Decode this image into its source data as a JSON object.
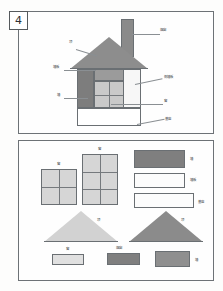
{
  "page": {
    "number": "4",
    "background": "#fdfdfc",
    "border_color": "#6d7276"
  },
  "palette": {
    "roof_gray": "#8d8d8d",
    "chimney_gray": "#8a8a8a",
    "wall_dark": "#7d7d7d",
    "wall_light": "#c9c9c9",
    "wall_white": "#f7f7f7",
    "foundation_white": "#ffffff",
    "window_light": "#d6d6d6",
    "triangle_light": "#d2d2d2",
    "triangle_dark": "#8b8b8b",
    "rect_dark": "#7f7f7f",
    "rect_medium": "#8f8f8f",
    "rect_light": "#e0e0e0",
    "rect_white": "#fcfcfc",
    "outline": "#6a6f73",
    "leader": "#8a8f93",
    "text": "#44484b"
  },
  "top_panel": {
    "title": "house-assembly-diagram",
    "labels": [
      {
        "id": "chimney",
        "text": "烟囱",
        "x": 158,
        "y": 29
      },
      {
        "id": "roof",
        "text": "顶",
        "x": 69,
        "y": 41
      },
      {
        "id": "gable",
        "text": "墙板",
        "x": 58,
        "y": 65
      },
      {
        "id": "wall",
        "text": "墙",
        "x": 58,
        "y": 93
      },
      {
        "id": "side-panel",
        "text": "侧墙板",
        "x": 163,
        "y": 78
      },
      {
        "id": "window",
        "text": "窗",
        "x": 163,
        "y": 99
      },
      {
        "id": "base",
        "text": "基座",
        "x": 163,
        "y": 119
      }
    ],
    "parts": [
      {
        "id": "chimney",
        "name": "chimney-shape"
      },
      {
        "id": "roof",
        "name": "roof-triangle"
      },
      {
        "id": "wall-dark",
        "name": "left-wall-panel"
      },
      {
        "id": "wall-white",
        "name": "right-wall-panel"
      },
      {
        "id": "window-grid",
        "name": "window-grid"
      },
      {
        "id": "foundation",
        "name": "foundation-strip"
      }
    ]
  },
  "bottom_panel": {
    "title": "parts-inventory",
    "items": [
      {
        "id": "window-small",
        "label": "窗",
        "shape": "grid",
        "cols": 2,
        "rows": 2,
        "fill": "#d6d6d6"
      },
      {
        "id": "window-tall",
        "label": "窗",
        "shape": "grid",
        "cols": 2,
        "rows": 3,
        "fill": "#d6d6d6"
      },
      {
        "id": "wall-dark",
        "label": "墙",
        "shape": "rect",
        "fill": "#7f7f7f"
      },
      {
        "id": "wall-板",
        "label": "墙板",
        "shape": "rect",
        "fill": "#fcfcfc"
      },
      {
        "id": "base-strip",
        "label": "基座",
        "shape": "rect",
        "fill": "#fcfcfc"
      },
      {
        "id": "roof-light",
        "label": "顶",
        "shape": "triangle",
        "fill": "#d2d2d2"
      },
      {
        "id": "roof-dark",
        "label": "顶",
        "shape": "triangle",
        "fill": "#8b8b8b"
      },
      {
        "id": "strip-light",
        "label": "窗",
        "shape": "rect",
        "fill": "#e0e0e0"
      },
      {
        "id": "strip-dark",
        "label": "烟囱",
        "shape": "rect",
        "fill": "#7f7f7f"
      },
      {
        "id": "strip-medium",
        "label": "墙",
        "shape": "rect",
        "fill": "#8f8f8f"
      }
    ]
  }
}
